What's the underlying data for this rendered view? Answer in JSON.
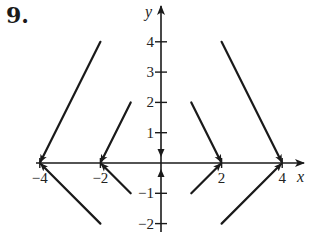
{
  "problem": {
    "number": "9."
  },
  "axes": {
    "x_label": "x",
    "y_label": "y",
    "x_ticks": [
      {
        "value": -4,
        "label": "−4"
      },
      {
        "value": -2,
        "label": "−2"
      },
      {
        "value": 2,
        "label": "2"
      },
      {
        "value": 4,
        "label": "4"
      }
    ],
    "y_ticks": [
      {
        "value": 4,
        "label": "4"
      },
      {
        "value": 3,
        "label": "3"
      },
      {
        "value": 2,
        "label": "2"
      },
      {
        "value": 1,
        "label": "1"
      },
      {
        "value": -1,
        "label": "−1"
      },
      {
        "value": -2,
        "label": "−2"
      }
    ],
    "xlim": [
      -4.3,
      4.7
    ],
    "ylim": [
      -2.3,
      4.7
    ]
  },
  "diagram": {
    "type": "vector-field-orbits",
    "segments": [
      {
        "from": [
          -2,
          4
        ],
        "to": [
          -4,
          0
        ]
      },
      {
        "from": [
          -2,
          -2
        ],
        "to": [
          -4,
          0
        ]
      },
      {
        "from": [
          -1,
          2
        ],
        "to": [
          -2,
          0
        ]
      },
      {
        "from": [
          -1,
          -1
        ],
        "to": [
          -2,
          0
        ]
      },
      {
        "from": [
          1,
          2
        ],
        "to": [
          2,
          0
        ]
      },
      {
        "from": [
          1,
          -1
        ],
        "to": [
          2,
          0
        ]
      },
      {
        "from": [
          2,
          4
        ],
        "to": [
          4,
          0
        ]
      },
      {
        "from": [
          2,
          -2
        ],
        "to": [
          4,
          0
        ]
      }
    ],
    "y_axis_arrows": [
      {
        "at": [
          0,
          0.2
        ],
        "direction": "down"
      },
      {
        "at": [
          0,
          -0.2
        ],
        "direction": "up"
      }
    ],
    "stroke_color": "#1a1a1a"
  }
}
